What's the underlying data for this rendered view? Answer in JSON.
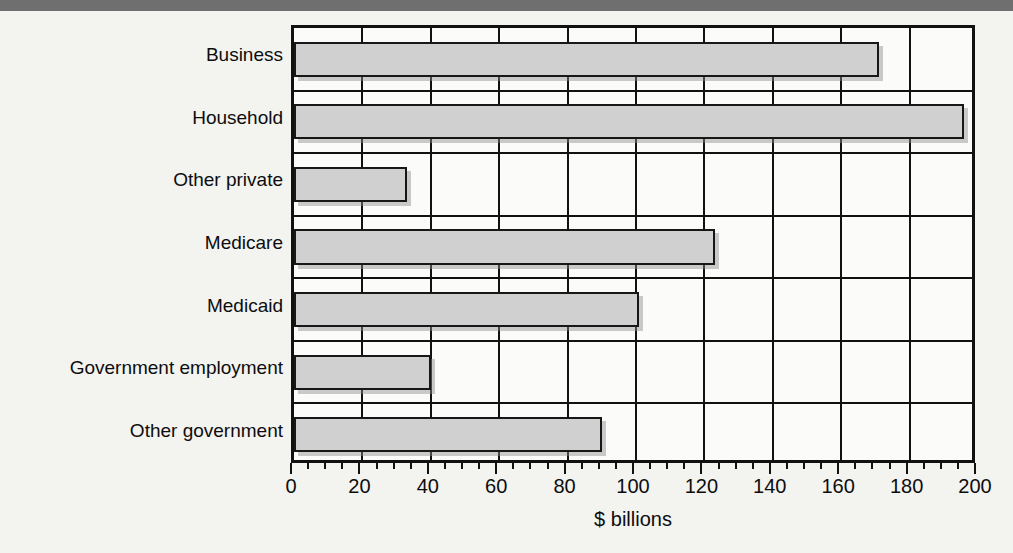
{
  "chart_data": {
    "type": "bar",
    "orientation": "horizontal",
    "title": "",
    "xlabel": "$ billions",
    "ylabel": "",
    "categories": [
      "Business",
      "Household",
      "Other private",
      "Medicare",
      "Medicaid",
      "Government employment",
      "Other government"
    ],
    "values": [
      171,
      196,
      33,
      123,
      101,
      40,
      90
    ],
    "xlim": [
      0,
      200
    ],
    "xticks": [
      0,
      20,
      40,
      60,
      80,
      100,
      120,
      140,
      160,
      180,
      200
    ],
    "xtick_labels": [
      "0",
      "20",
      "40",
      "60",
      "80",
      "100",
      "120",
      "140",
      "160",
      "180",
      "200"
    ],
    "minor_tick_step": 5,
    "grid": "vertical",
    "legend": "none",
    "bar_fill_color": "#d0d0d0",
    "bar_edge_color": "#171717",
    "frame_color": "#111111"
  },
  "figure": {
    "background_color": "#f3f3f0",
    "top_strip_color": "#6f6f6f"
  }
}
